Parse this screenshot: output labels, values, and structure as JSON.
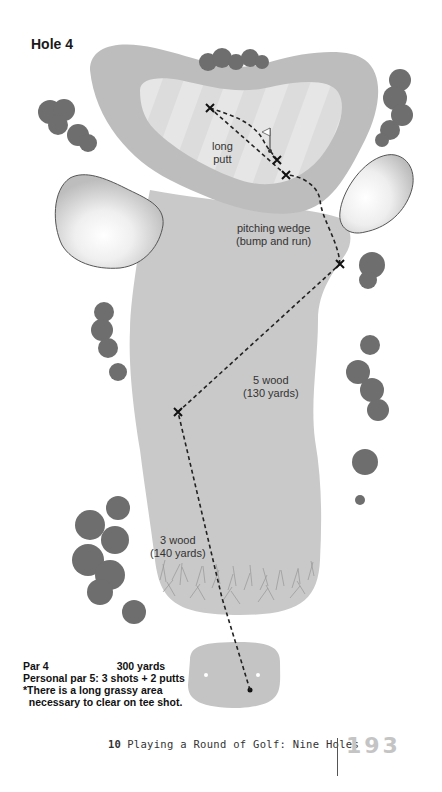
{
  "hole": {
    "title": "Hole 4"
  },
  "shots": [
    {
      "club": "3 wood",
      "distance": "(140 yards)"
    },
    {
      "club": "5 wood",
      "distance": "(130 yards)"
    },
    {
      "club": "pitching wedge",
      "distance": "(bump and run)"
    },
    {
      "club": "long",
      "distance": "putt"
    }
  ],
  "info": {
    "par": "Par 4",
    "yards": "300 yards",
    "personal_par": "Personal par 5: 3 shots + 2 putts",
    "note_line1": "*There is a long grassy area",
    "note_line2": "  necessary to clear on tee shot."
  },
  "footer": {
    "chapter_number": "10",
    "chapter_title": "Playing a Round of Golf: Nine Holes",
    "page_number": "193"
  },
  "colors": {
    "fairway": "#c9c9c9",
    "rough_ring": "#bdbdbd",
    "green": "#e3e3e3",
    "tree": "#6e6e6e",
    "page_number": "#c4c4c4"
  }
}
